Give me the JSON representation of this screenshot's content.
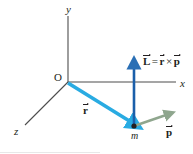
{
  "figure": {
    "background_color": "#ffffff"
  },
  "axes": {
    "x_label": "x",
    "y_label": "y",
    "z_label": "z",
    "origin_label": "O",
    "axis_color": "#4d4d4d"
  },
  "vectors": {
    "r": {
      "label": "r",
      "color": "#29abe2",
      "description": "position vector from origin to mass"
    },
    "p": {
      "label": "p",
      "color": "#8fa68e",
      "description": "linear momentum vector at mass"
    },
    "L": {
      "label": "L",
      "color": "#1b5faa",
      "description": "angular momentum vector, vertical"
    }
  },
  "equation": {
    "lhs": "L",
    "equals": "=",
    "op_first": "r",
    "cross": "×",
    "op_second": "p",
    "full_text": "L = r × p"
  },
  "mass": {
    "label": "m",
    "point_color": "#231f20"
  }
}
